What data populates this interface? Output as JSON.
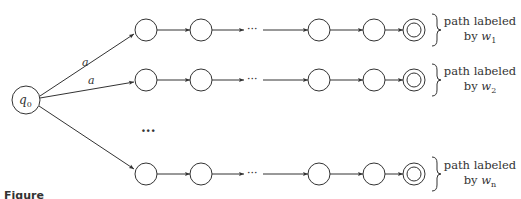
{
  "diagram": {
    "type": "finite-automaton",
    "start_state": {
      "label": "q",
      "subscript": "0"
    },
    "edge_labels": [
      "a",
      "a"
    ],
    "colors": {
      "stroke": "#333333",
      "fill": "#ffffff",
      "text": "#333333"
    },
    "rows": [
      {
        "word": "w",
        "subscript": "1",
        "label_prefix": "path labeled",
        "label_by": "by"
      },
      {
        "word": "w",
        "subscript": "2",
        "label_prefix": "path labeled",
        "label_by": "by"
      },
      {
        "word": "w",
        "subscript": "n",
        "label_prefix": "path labeled",
        "label_by": "by"
      }
    ],
    "horizontal_ellipsis": "···",
    "vertical_ellipsis": "···"
  },
  "caption": {
    "figure_label": "Figure",
    "text": ""
  }
}
